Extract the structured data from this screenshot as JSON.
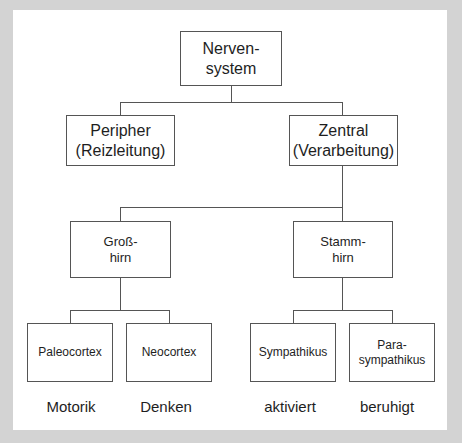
{
  "diagram": {
    "title": "",
    "root": {
      "label": "Nerven-\nsystem"
    },
    "level1": [
      {
        "label": "Peripher\n(Reizleitung)"
      },
      {
        "label": "Zentral\n(Verarbeitung)"
      }
    ],
    "level2": [
      {
        "label": "Groß-\nhirn"
      },
      {
        "label": "Stamm-\nhirn"
      }
    ],
    "level3": [
      {
        "label": "Paleocortex",
        "parent": "Groß-hirn"
      },
      {
        "label": "Neocortex",
        "parent": "Groß-hirn"
      },
      {
        "label": "Sympathikus",
        "parent": "Stamm-hirn"
      },
      {
        "label": "Para-\nsympathikus",
        "parent": "Stamm-hirn"
      }
    ],
    "captions": [
      "Motorik",
      "Denken",
      "aktiviert",
      "beruhigt"
    ],
    "colors": {
      "background": "#d3d3d3",
      "panel": "#ffffff",
      "line": "#555555",
      "text": "#1e1e1e"
    }
  }
}
